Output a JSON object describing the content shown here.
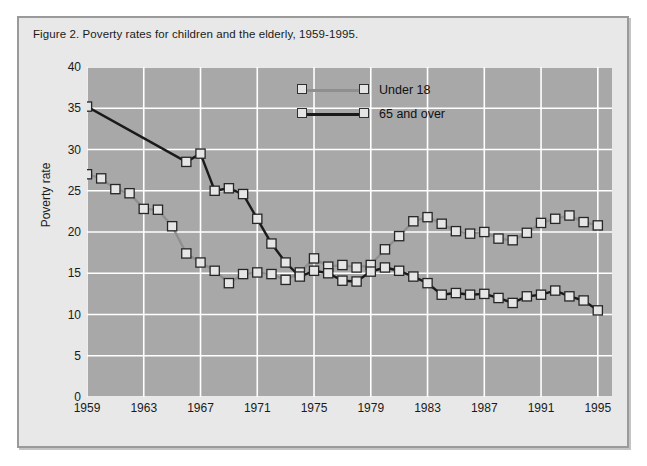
{
  "figure": {
    "caption": "Figure 2. Poverty rates for children and the elderly, 1959-1995."
  },
  "legend": {
    "position": "top-center-inside",
    "items": [
      {
        "label": "Under 18",
        "color": "#8f8f8f"
      },
      {
        "label": "65 and over",
        "color": "#1a1a1a"
      }
    ]
  },
  "chart_data": {
    "type": "line",
    "title": "Figure 2. Poverty rates for children and the elderly, 1959-1995.",
    "xlabel": "",
    "ylabel": "Poverty rate",
    "xlim": [
      1959,
      1996
    ],
    "ylim": [
      0,
      40
    ],
    "yticks": [
      0,
      5,
      10,
      15,
      20,
      25,
      30,
      35,
      40
    ],
    "xticks": [
      1959,
      1963,
      1967,
      1971,
      1975,
      1979,
      1983,
      1987,
      1991,
      1995
    ],
    "grid": true,
    "plot_background": "#a8a8a8",
    "gridline_color": "#ffffff",
    "marker": "square",
    "x": [
      1959,
      1960,
      1961,
      1962,
      1963,
      1964,
      1965,
      1966,
      1967,
      1968,
      1969,
      1970,
      1971,
      1972,
      1973,
      1974,
      1975,
      1976,
      1977,
      1978,
      1979,
      1980,
      1981,
      1982,
      1983,
      1984,
      1985,
      1986,
      1987,
      1988,
      1989,
      1990,
      1991,
      1992,
      1993,
      1994,
      1995
    ],
    "series": [
      {
        "name": "Under 18",
        "color": "#8f8f8f",
        "values": [
          27.0,
          26.5,
          25.2,
          24.7,
          22.8,
          22.7,
          20.7,
          17.4,
          16.3,
          15.3,
          13.8,
          14.9,
          15.1,
          14.9,
          14.2,
          15.1,
          16.8,
          15.8,
          16.0,
          15.7,
          16.0,
          17.9,
          19.5,
          21.3,
          21.8,
          21.0,
          20.1,
          19.8,
          20.0,
          19.2,
          19.0,
          19.9,
          21.1,
          21.6,
          22.0,
          21.2,
          20.8
        ]
      },
      {
        "name": "65 and over",
        "color": "#1a1a1a",
        "values": [
          35.2,
          null,
          null,
          null,
          null,
          null,
          null,
          28.5,
          29.5,
          25.0,
          25.3,
          24.6,
          21.6,
          18.6,
          16.3,
          14.6,
          15.3,
          15.0,
          14.1,
          14.0,
          15.2,
          15.7,
          15.3,
          14.6,
          13.8,
          12.4,
          12.6,
          12.4,
          12.5,
          12.0,
          11.4,
          12.2,
          12.4,
          12.9,
          12.2,
          11.7,
          10.5
        ]
      }
    ]
  }
}
